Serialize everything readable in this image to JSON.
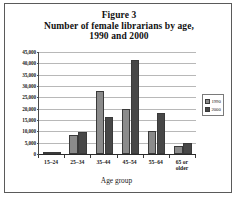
{
  "figure": {
    "title_lines": [
      "Figure 3",
      "Number of female librarians by age,",
      "1990 and 2000"
    ]
  },
  "chart_data": {
    "type": "bar",
    "title": "Figure 3 Number of female librarians by age, 1990 and 2000",
    "xlabel": "Age group",
    "ylabel": "",
    "categories": [
      "15–24",
      "25–34",
      "35–44",
      "45–54",
      "55–64",
      "65 or\nolder"
    ],
    "series": [
      {
        "name": "1990",
        "color": "#8b8b8b",
        "values": [
          700,
          8300,
          28000,
          20000,
          10000,
          3500
        ]
      },
      {
        "name": "2000",
        "color": "#474747",
        "values": [
          500,
          9500,
          16500,
          41500,
          18200,
          4700
        ]
      }
    ],
    "ylim": [
      0,
      45000
    ],
    "ytick_labels": [
      "0",
      "5,000",
      "10,000",
      "15,000",
      "20,000",
      "25,000",
      "30,000",
      "35,000",
      "40,000",
      "45,000"
    ],
    "ytick_values": [
      0,
      5000,
      10000,
      15000,
      20000,
      25000,
      30000,
      35000,
      40000,
      45000
    ],
    "grid": true,
    "legend_position": "right"
  },
  "legend": {
    "entries": [
      {
        "label": "1990"
      },
      {
        "label": "2000"
      }
    ]
  }
}
